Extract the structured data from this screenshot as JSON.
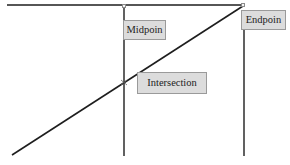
{
  "diagram": {
    "colors": {
      "line": "#1e1e1e",
      "label_bg": "#dcdcdc",
      "label_border": "#9a9a9a",
      "background": "#ffffff"
    },
    "lines": [
      {
        "name": "top-horizontal-line",
        "x1": 7,
        "y1": 5,
        "x2": 243,
        "y2": 5
      },
      {
        "name": "midpoint-vertical-line",
        "x1": 124,
        "y1": 6,
        "x2": 124,
        "y2": 156
      },
      {
        "name": "endpoint-vertical-line",
        "x1": 244,
        "y1": 29,
        "x2": 244,
        "y2": 156
      },
      {
        "name": "diagonal-line",
        "x1": 12,
        "y1": 155,
        "x2": 243,
        "y2": 6
      }
    ],
    "labels": {
      "midpoint": "Midpoin",
      "endpoint": "Endpoin",
      "intersection": "Intersection"
    },
    "points": {
      "midpoint": {
        "x": 124,
        "y": 6
      },
      "endpoint": {
        "x": 243,
        "y": 5
      },
      "intersection": {
        "x": 124,
        "y": 82
      }
    }
  }
}
